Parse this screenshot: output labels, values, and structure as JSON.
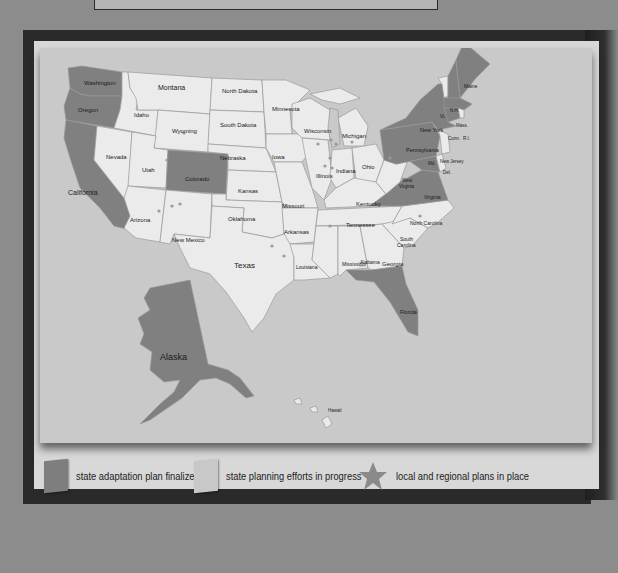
{
  "colors": {
    "background": "#8c8c8c",
    "frame": "#2a2a2a",
    "panel": "#d8d8d8",
    "ocean": "#c9c9c9",
    "finalized": "#808080",
    "in_progress": "#ebebeb",
    "border": "#9a9a9a"
  },
  "map": {
    "states": {
      "washington": "Washington",
      "oregon": "Oregon",
      "california": "California",
      "idaho": "Idaho",
      "nevada": "Nevada",
      "montana": "Montana",
      "wyoming": "Wyoming",
      "utah": "Utah",
      "colorado": "Colorado",
      "arizona": "Arizona",
      "new_mexico": "New Mexico",
      "north_dakota": "North Dakota",
      "south_dakota": "South Dakota",
      "nebraska": "Nebraska",
      "kansas": "Kansas",
      "oklahoma": "Oklahoma",
      "texas": "Texas",
      "minnesota": "Minnesota",
      "iowa": "Iowa",
      "missouri": "Missouri",
      "arkansas": "Arkansas",
      "louisiana": "Louisiana",
      "wisconsin": "Wisconsin",
      "illinois": "Illinois",
      "michigan": "Michigan",
      "indiana": "Indiana",
      "ohio": "Ohio",
      "kentucky": "Kentucky",
      "tennessee": "Tennessee",
      "mississippi": "Mississippi",
      "alabama": "Alabama",
      "georgia": "Georgia",
      "florida": "Florida",
      "south_carolina_1": "South",
      "south_carolina_2": "Carolina",
      "north_carolina": "North Carolina",
      "virginia": "Virginia",
      "west_virginia_1": "West",
      "west_virginia_2": "Virginia",
      "pennsylvania": "Pennsylvania",
      "new_york": "New York",
      "new_jersey": "New Jersey",
      "maryland": "Md.",
      "delaware": "Del.",
      "connecticut": "Conn.",
      "rhode_island": "R.I.",
      "massachusetts": "Mass.",
      "vermont": "Vt.",
      "new_hampshire": "N.H.",
      "maine": "Maine",
      "alaska": "Alaska",
      "hawaii": "Hawaii"
    },
    "finalized_states": [
      "Washington",
      "Oregon",
      "California",
      "Colorado",
      "Florida",
      "Virginia",
      "Maryland",
      "Pennsylvania",
      "New York",
      "Massachusetts",
      "Connecticut",
      "New Hampshire",
      "Maine",
      "Alaska"
    ]
  },
  "legend": {
    "items": [
      {
        "label": "state adaptation plan finalized",
        "icon": "dark-square-swatch"
      },
      {
        "label": "state planning efforts in progress",
        "icon": "light-square-swatch"
      },
      {
        "label": "local and regional plans in place",
        "icon": "star-icon"
      }
    ]
  }
}
